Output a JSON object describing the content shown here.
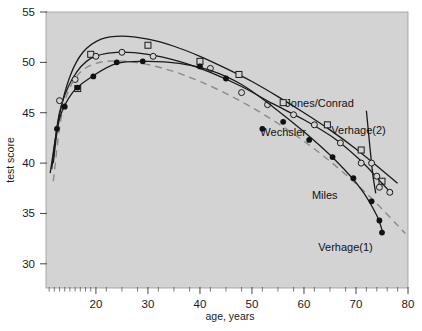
{
  "chart_data": {
    "type": "line",
    "title": "",
    "xlabel": "age, years",
    "ylabel": "test score",
    "xlim": [
      10.4,
      80
    ],
    "ylim": [
      27.6,
      55
    ],
    "xticks": [
      20,
      30,
      40,
      50,
      60,
      70,
      80
    ],
    "yticks": [
      30,
      35,
      40,
      45,
      50,
      55
    ],
    "grid": false,
    "legend_position": "inline-annotations",
    "plot_background": "#d3d3d3",
    "series": [
      {
        "name": "Jones/Conrad",
        "marker": "open-square",
        "line_style": "solid",
        "color": "#1a1a1a",
        "label_x": 63,
        "label_y": 45.6,
        "points": [
          {
            "x": 16.5,
            "y": 47.4
          },
          {
            "x": 19.0,
            "y": 50.8
          },
          {
            "x": 30.0,
            "y": 51.7
          },
          {
            "x": 40.0,
            "y": 50.1
          },
          {
            "x": 47.5,
            "y": 48.8
          },
          {
            "x": 56.0,
            "y": 46.0
          },
          {
            "x": 64.5,
            "y": 43.8
          },
          {
            "x": 71.0,
            "y": 41.3
          },
          {
            "x": 75.0,
            "y": 38.2
          }
        ],
        "curve": [
          {
            "x": 11.2,
            "y": 39.0
          },
          {
            "x": 13.0,
            "y": 44.8
          },
          {
            "x": 15.0,
            "y": 48.6
          },
          {
            "x": 17.5,
            "y": 51.0
          },
          {
            "x": 21.0,
            "y": 52.3
          },
          {
            "x": 25.0,
            "y": 52.6
          },
          {
            "x": 30.0,
            "y": 52.3
          },
          {
            "x": 35.0,
            "y": 51.6
          },
          {
            "x": 40.0,
            "y": 50.6
          },
          {
            "x": 45.0,
            "y": 49.4
          },
          {
            "x": 50.0,
            "y": 48.1
          },
          {
            "x": 55.0,
            "y": 46.6
          },
          {
            "x": 60.0,
            "y": 45.0
          },
          {
            "x": 65.0,
            "y": 43.3
          },
          {
            "x": 70.0,
            "y": 41.4
          },
          {
            "x": 75.0,
            "y": 39.3
          },
          {
            "x": 78.0,
            "y": 38.0
          }
        ]
      },
      {
        "name": "Wechsler",
        "marker": "open-circle",
        "line_style": "solid",
        "color": "#1a1a1a",
        "label_x": 56,
        "label_y": 42.7,
        "points": [
          {
            "x": 13.0,
            "y": 46.2
          },
          {
            "x": 16.0,
            "y": 48.3
          },
          {
            "x": 20.0,
            "y": 50.6
          },
          {
            "x": 25.0,
            "y": 51.0
          },
          {
            "x": 31.0,
            "y": 50.6
          },
          {
            "x": 42.0,
            "y": 49.4
          },
          {
            "x": 48.0,
            "y": 47.0
          },
          {
            "x": 53.0,
            "y": 45.8
          },
          {
            "x": 58.0,
            "y": 44.8
          },
          {
            "x": 62.0,
            "y": 43.8
          },
          {
            "x": 67.0,
            "y": 42.0
          },
          {
            "x": 71.0,
            "y": 40.0
          },
          {
            "x": 74.0,
            "y": 38.7
          },
          {
            "x": 76.5,
            "y": 37.1
          }
        ],
        "curve": [
          {
            "x": 11.5,
            "y": 39.4
          },
          {
            "x": 13.0,
            "y": 45.0
          },
          {
            "x": 15.5,
            "y": 48.4
          },
          {
            "x": 19.0,
            "y": 50.4
          },
          {
            "x": 24.0,
            "y": 51.0
          },
          {
            "x": 30.0,
            "y": 50.8
          },
          {
            "x": 36.0,
            "y": 50.1
          },
          {
            "x": 42.0,
            "y": 49.0
          },
          {
            "x": 48.0,
            "y": 47.6
          },
          {
            "x": 54.0,
            "y": 45.9
          },
          {
            "x": 60.0,
            "y": 44.3
          },
          {
            "x": 66.0,
            "y": 42.4
          },
          {
            "x": 71.0,
            "y": 40.2
          },
          {
            "x": 75.0,
            "y": 38.0
          },
          {
            "x": 77.0,
            "y": 36.9
          }
        ]
      },
      {
        "name": "Verhage(2)",
        "marker": "open-circle",
        "line_style": "solid-steep",
        "color": "#1a1a1a",
        "label_x": 70.5,
        "label_y": 42.9,
        "points": [
          {
            "x": 73.0,
            "y": 40.0
          },
          {
            "x": 74.5,
            "y": 37.6
          }
        ],
        "curve": [
          {
            "x": 72.0,
            "y": 45.2
          },
          {
            "x": 72.6,
            "y": 42.0
          },
          {
            "x": 73.2,
            "y": 39.0
          },
          {
            "x": 73.8,
            "y": 37.0
          }
        ]
      },
      {
        "name": "Miles",
        "marker": "none",
        "line_style": "dashed",
        "color": "#8a8a8a",
        "label_x": 64,
        "label_y": 36.4,
        "points": [],
        "curve": [
          {
            "x": 11.8,
            "y": 38.2
          },
          {
            "x": 13.5,
            "y": 45.0
          },
          {
            "x": 16.0,
            "y": 48.4
          },
          {
            "x": 20.0,
            "y": 49.9
          },
          {
            "x": 26.0,
            "y": 50.1
          },
          {
            "x": 33.0,
            "y": 49.4
          },
          {
            "x": 40.0,
            "y": 48.1
          },
          {
            "x": 48.0,
            "y": 46.1
          },
          {
            "x": 56.0,
            "y": 43.6
          },
          {
            "x": 64.0,
            "y": 40.6
          },
          {
            "x": 72.0,
            "y": 37.0
          },
          {
            "x": 79.5,
            "y": 33.0
          }
        ]
      },
      {
        "name": "Verhage(1)",
        "marker": "filled-circle",
        "line_style": "solid",
        "color": "#1a1a1a",
        "label_x": 68,
        "label_y": 31.3,
        "points": [
          {
            "x": 12.5,
            "y": 43.4
          },
          {
            "x": 14.0,
            "y": 45.6
          },
          {
            "x": 16.5,
            "y": 47.5
          },
          {
            "x": 19.5,
            "y": 48.6
          },
          {
            "x": 24.0,
            "y": 50.0
          },
          {
            "x": 29.0,
            "y": 50.1
          },
          {
            "x": 40.0,
            "y": 49.6
          },
          {
            "x": 45.0,
            "y": 48.4
          },
          {
            "x": 52.0,
            "y": 43.4
          },
          {
            "x": 56.0,
            "y": 44.1
          },
          {
            "x": 61.0,
            "y": 42.3
          },
          {
            "x": 65.5,
            "y": 40.6
          },
          {
            "x": 69.5,
            "y": 38.5
          },
          {
            "x": 73.0,
            "y": 36.2
          },
          {
            "x": 74.5,
            "y": 34.3
          },
          {
            "x": 75.0,
            "y": 33.1
          }
        ],
        "curve": [
          {
            "x": 11.8,
            "y": 40.0
          },
          {
            "x": 13.0,
            "y": 44.4
          },
          {
            "x": 15.5,
            "y": 47.0
          },
          {
            "x": 19.0,
            "y": 48.5
          },
          {
            "x": 24.0,
            "y": 49.9
          },
          {
            "x": 30.0,
            "y": 50.1
          },
          {
            "x": 36.0,
            "y": 49.9
          },
          {
            "x": 42.0,
            "y": 49.2
          },
          {
            "x": 48.0,
            "y": 47.8
          },
          {
            "x": 54.0,
            "y": 45.6
          },
          {
            "x": 60.0,
            "y": 43.1
          },
          {
            "x": 66.0,
            "y": 40.3
          },
          {
            "x": 71.0,
            "y": 37.4
          },
          {
            "x": 74.0,
            "y": 34.8
          },
          {
            "x": 75.2,
            "y": 33.0
          }
        ]
      }
    ]
  },
  "axes": {
    "y_label": "test score",
    "x_label": "age, years",
    "y_tick_labels": [
      "55",
      "50",
      "45",
      "40",
      "35",
      "30"
    ],
    "x_tick_labels": [
      "20",
      "30",
      "40",
      "50",
      "60",
      "70",
      "80"
    ]
  },
  "annotations": [
    {
      "text": "Jones/Conrad"
    },
    {
      "text": "Wechsler"
    },
    {
      "text": "Verhage(2)"
    },
    {
      "text": "Miles"
    },
    {
      "text": "Verhage(1)"
    }
  ]
}
